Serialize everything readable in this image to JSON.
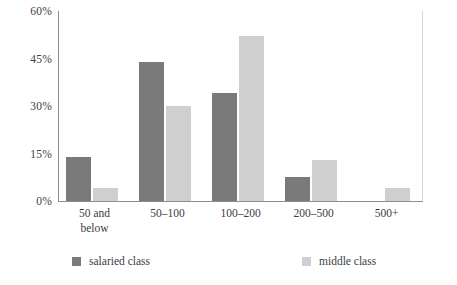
{
  "chart_data": {
    "type": "bar",
    "title": "",
    "subtitle": "",
    "xlabel": "",
    "ylabel": "",
    "grid": false,
    "legend_position": "bottom",
    "categories": [
      "50 and below",
      "50–100",
      "100–200",
      "200–500",
      "500+"
    ],
    "ylim": [
      0,
      60
    ],
    "yticks": [
      0,
      15,
      30,
      45,
      60
    ],
    "ytick_labels": [
      "0%",
      "15%",
      "30%",
      "45%",
      "60%"
    ],
    "series": [
      {
        "name": "salaried class",
        "color": "#7a7a7a",
        "values": [
          14,
          44,
          34,
          7.5,
          0
        ]
      },
      {
        "name": "middle class",
        "color": "#cfcfcf",
        "values": [
          4,
          30,
          52,
          13,
          4
        ]
      }
    ]
  },
  "axis": {
    "ticks": [
      {
        "label": "60%",
        "value": 60
      },
      {
        "label": "45%",
        "value": 45
      },
      {
        "label": "30%",
        "value": 30
      },
      {
        "label": "15%",
        "value": 15
      },
      {
        "label": "0%",
        "value": 0
      }
    ],
    "categories": [
      {
        "line1": "50 and",
        "line2": "below"
      },
      {
        "line1": "50–100",
        "line2": ""
      },
      {
        "line1": "100–200",
        "line2": ""
      },
      {
        "line1": "200–500",
        "line2": ""
      },
      {
        "line1": "500+",
        "line2": ""
      }
    ]
  },
  "legend": {
    "items": [
      {
        "label": "salaried class",
        "color": "#7a7a7a",
        "swatch_name": "legend-swatch-salaried"
      },
      {
        "label": "middle class",
        "color": "#cfcfcf",
        "swatch_name": "legend-swatch-middle"
      }
    ]
  },
  "colors": {
    "salaried": "#7a7a7a",
    "middle": "#cfcfcf",
    "axis": "#8e8e8e",
    "axis_right": "#d8d8d8",
    "text": "#3d3d3d",
    "background": "#ffffff"
  }
}
